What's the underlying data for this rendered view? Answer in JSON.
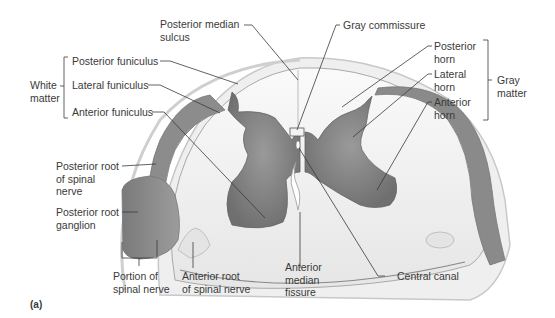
{
  "figure": {
    "panel_label": "(a)"
  },
  "labels": {
    "posterior_median_sulcus": "Posterior median\nsulcus",
    "gray_commissure": "Gray commissure",
    "white_matter": "White\nmatter",
    "posterior_funiculus": "Posterior funiculus",
    "lateral_funiculus": "Lateral funiculus",
    "anterior_funiculus": "Anterior funiculus",
    "posterior_horn": "Posterior\nhorn",
    "lateral_horn": "Lateral\nhorn",
    "anterior_horn": "Anterior\nhorn",
    "gray_matter": "Gray\nmatter",
    "posterior_root_spinal_nerve": "Posterior root\nof spinal\nnerve",
    "posterior_root_ganglion": "Posterior root\nganglion",
    "portion_spinal_nerve": "Portion of\nspinal nerve",
    "anterior_root_spinal_nerve": "Anterior root\nof spinal nerve",
    "anterior_median_fissure": "Anterior\nmedian\nfissure",
    "central_canal": "Central canal"
  },
  "colors": {
    "gray_matter": "#8a8a8a",
    "white_matter": "#f2f2f2",
    "outline": "#bdbdbd",
    "leader_line": "#3a3a3a"
  }
}
